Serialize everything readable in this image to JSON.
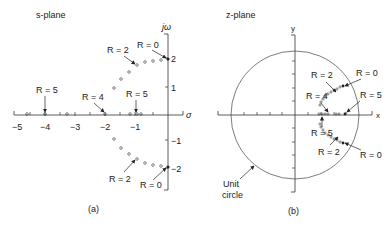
{
  "s_plane": {
    "title": "s-plane",
    "caption": "(a)",
    "x_axis_label": "σ",
    "y_axis_label": "jω",
    "x_ticks": [
      {
        "value": -5,
        "label": "−5"
      },
      {
        "value": -4,
        "label": "−4"
      },
      {
        "value": -3,
        "label": "−3"
      },
      {
        "value": -2,
        "label": "−2"
      },
      {
        "value": -1,
        "label": "−1"
      }
    ],
    "y_ticks": [
      {
        "value": 2,
        "label": "2"
      },
      {
        "value": 1,
        "label": "1"
      },
      {
        "value": -1,
        "label": "−1"
      },
      {
        "value": -2,
        "label": "−2"
      }
    ],
    "annotations": [
      {
        "label": "R = 0",
        "target": "upper"
      },
      {
        "label": "R = 2",
        "target": "upper"
      },
      {
        "label": "R = 5",
        "target": "real-left"
      },
      {
        "label": "R = 4",
        "target": "real"
      },
      {
        "label": "R = 5",
        "target": "real-right"
      },
      {
        "label": "R = 2",
        "target": "lower"
      },
      {
        "label": "R = 0",
        "target": "lower"
      }
    ]
  },
  "z_plane": {
    "title": "z-plane",
    "caption": "(b)",
    "x_axis_label": "x",
    "y_axis_label": "y",
    "circle_label_line1": "Unit",
    "circle_label_line2": "circle",
    "annotations": [
      {
        "label": "R = 2",
        "target": "upper"
      },
      {
        "label": "R = 0",
        "target": "upper"
      },
      {
        "label": "R = 4",
        "target": "real"
      },
      {
        "label": "R = 5",
        "target": "real-right"
      },
      {
        "label": "R = 5",
        "target": "real-left"
      },
      {
        "label": "R = 2",
        "target": "lower"
      },
      {
        "label": "R = 0",
        "target": "lower"
      }
    ]
  }
}
